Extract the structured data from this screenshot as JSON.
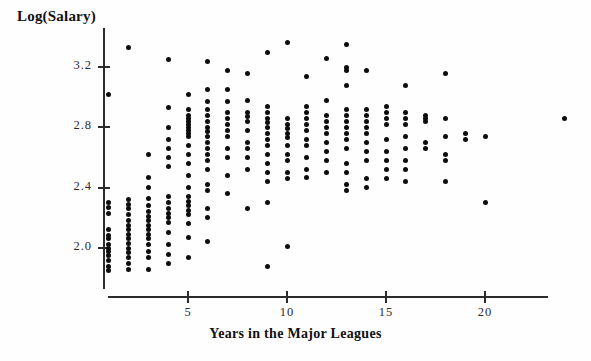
{
  "chart_data": {
    "type": "scatter",
    "title": "",
    "ylabel": "Log(Salary)",
    "xlabel": "Years in the Major Leagues",
    "grid": false,
    "legend": null,
    "xlim": [
      0,
      24.5
    ],
    "ylim": [
      1.8,
      3.45
    ],
    "xticks": [
      5,
      10,
      15,
      20
    ],
    "xtick_labels": [
      "5",
      "10",
      "15",
      "20"
    ],
    "yticks": [
      2.0,
      2.4,
      2.8,
      3.2
    ],
    "ytick_labels": [
      "2.0",
      "2.4",
      "2.8",
      "3.2"
    ],
    "n_points": 263,
    "points": [
      [
        1,
        3.02
      ],
      [
        1,
        2.3
      ],
      [
        1,
        2.27
      ],
      [
        1,
        2.23
      ],
      [
        1,
        2.12
      ],
      [
        1,
        2.08
      ],
      [
        1,
        2.06
      ],
      [
        1,
        2.02
      ],
      [
        1,
        2.0
      ],
      [
        1,
        1.98
      ],
      [
        1,
        1.95
      ],
      [
        1,
        1.92
      ],
      [
        1,
        1.88
      ],
      [
        1,
        1.85
      ],
      [
        2,
        3.33
      ],
      [
        2,
        2.32
      ],
      [
        2,
        2.29
      ],
      [
        2,
        2.26
      ],
      [
        2,
        2.22
      ],
      [
        2,
        2.18
      ],
      [
        2,
        2.15
      ],
      [
        2,
        2.12
      ],
      [
        2,
        2.09
      ],
      [
        2,
        2.06
      ],
      [
        2,
        2.03
      ],
      [
        2,
        2.0
      ],
      [
        2,
        1.97
      ],
      [
        2,
        1.94
      ],
      [
        2,
        1.9
      ],
      [
        2,
        1.86
      ],
      [
        3,
        2.62
      ],
      [
        3,
        2.47
      ],
      [
        3,
        2.4
      ],
      [
        3,
        2.33
      ],
      [
        3,
        2.28
      ],
      [
        3,
        2.24
      ],
      [
        3,
        2.21
      ],
      [
        3,
        2.18
      ],
      [
        3,
        2.15
      ],
      [
        3,
        2.12
      ],
      [
        3,
        2.09
      ],
      [
        3,
        2.06
      ],
      [
        3,
        2.02
      ],
      [
        3,
        1.98
      ],
      [
        3,
        1.94
      ],
      [
        3,
        1.86
      ],
      [
        4,
        3.25
      ],
      [
        4,
        2.93
      ],
      [
        4,
        2.8
      ],
      [
        4,
        2.72
      ],
      [
        4,
        2.66
      ],
      [
        4,
        2.6
      ],
      [
        4,
        2.54
      ],
      [
        4,
        2.34
      ],
      [
        4,
        2.3
      ],
      [
        4,
        2.26
      ],
      [
        4,
        2.23
      ],
      [
        4,
        2.2
      ],
      [
        4,
        2.17
      ],
      [
        4,
        2.1
      ],
      [
        4,
        2.02
      ],
      [
        4,
        1.96
      ],
      [
        4,
        1.9
      ],
      [
        5,
        3.02
      ],
      [
        5,
        2.92
      ],
      [
        5,
        2.88
      ],
      [
        5,
        2.86
      ],
      [
        5,
        2.84
      ],
      [
        5,
        2.82
      ],
      [
        5,
        2.8
      ],
      [
        5,
        2.78
      ],
      [
        5,
        2.76
      ],
      [
        5,
        2.74
      ],
      [
        5,
        2.68
      ],
      [
        5,
        2.62
      ],
      [
        5,
        2.56
      ],
      [
        5,
        2.48
      ],
      [
        5,
        2.4
      ],
      [
        5,
        2.34
      ],
      [
        5,
        2.31
      ],
      [
        5,
        2.28
      ],
      [
        5,
        2.25
      ],
      [
        5,
        2.22
      ],
      [
        5,
        2.16
      ],
      [
        5,
        2.07
      ],
      [
        5,
        1.94
      ],
      [
        6,
        3.24
      ],
      [
        6,
        3.05
      ],
      [
        6,
        2.97
      ],
      [
        6,
        2.92
      ],
      [
        6,
        2.88
      ],
      [
        6,
        2.84
      ],
      [
        6,
        2.8
      ],
      [
        6,
        2.77
      ],
      [
        6,
        2.74
      ],
      [
        6,
        2.7
      ],
      [
        6,
        2.66
      ],
      [
        6,
        2.62
      ],
      [
        6,
        2.58
      ],
      [
        6,
        2.52
      ],
      [
        6,
        2.42
      ],
      [
        6,
        2.38
      ],
      [
        6,
        2.26
      ],
      [
        6,
        2.2
      ],
      [
        6,
        2.04
      ],
      [
        7,
        3.18
      ],
      [
        7,
        3.05
      ],
      [
        7,
        2.97
      ],
      [
        7,
        2.9
      ],
      [
        7,
        2.86
      ],
      [
        7,
        2.82
      ],
      [
        7,
        2.78
      ],
      [
        7,
        2.74
      ],
      [
        7,
        2.66
      ],
      [
        7,
        2.6
      ],
      [
        7,
        2.48
      ],
      [
        7,
        2.36
      ],
      [
        8,
        3.16
      ],
      [
        8,
        2.98
      ],
      [
        8,
        2.9
      ],
      [
        8,
        2.87
      ],
      [
        8,
        2.84
      ],
      [
        8,
        2.78
      ],
      [
        8,
        2.7
      ],
      [
        8,
        2.66
      ],
      [
        8,
        2.6
      ],
      [
        8,
        2.52
      ],
      [
        8,
        2.26
      ],
      [
        9,
        3.3
      ],
      [
        9,
        2.94
      ],
      [
        9,
        2.9
      ],
      [
        9,
        2.86
      ],
      [
        9,
        2.83
      ],
      [
        9,
        2.8
      ],
      [
        9,
        2.76
      ],
      [
        9,
        2.72
      ],
      [
        9,
        2.68
      ],
      [
        9,
        2.62
      ],
      [
        9,
        2.56
      ],
      [
        9,
        2.5
      ],
      [
        9,
        2.44
      ],
      [
        9,
        2.3
      ],
      [
        9,
        1.88
      ],
      [
        10,
        3.36
      ],
      [
        10,
        2.86
      ],
      [
        10,
        2.82
      ],
      [
        10,
        2.79
      ],
      [
        10,
        2.76
      ],
      [
        10,
        2.73
      ],
      [
        10,
        2.68
      ],
      [
        10,
        2.62
      ],
      [
        10,
        2.58
      ],
      [
        10,
        2.5
      ],
      [
        10,
        2.46
      ],
      [
        10,
        2.01
      ],
      [
        11,
        3.14
      ],
      [
        11,
        2.94
      ],
      [
        11,
        2.9
      ],
      [
        11,
        2.86
      ],
      [
        11,
        2.82
      ],
      [
        11,
        2.78
      ],
      [
        11,
        2.72
      ],
      [
        11,
        2.68
      ],
      [
        11,
        2.6
      ],
      [
        11,
        2.52
      ],
      [
        11,
        2.47
      ],
      [
        12,
        3.26
      ],
      [
        12,
        2.98
      ],
      [
        12,
        2.88
      ],
      [
        12,
        2.84
      ],
      [
        12,
        2.8
      ],
      [
        12,
        2.76
      ],
      [
        12,
        2.7
      ],
      [
        12,
        2.64
      ],
      [
        12,
        2.58
      ],
      [
        12,
        2.5
      ],
      [
        13,
        3.35
      ],
      [
        13,
        3.2
      ],
      [
        13,
        3.18
      ],
      [
        13,
        3.08
      ],
      [
        13,
        2.92
      ],
      [
        13,
        2.88
      ],
      [
        13,
        2.84
      ],
      [
        13,
        2.8
      ],
      [
        13,
        2.76
      ],
      [
        13,
        2.72
      ],
      [
        13,
        2.66
      ],
      [
        13,
        2.56
      ],
      [
        13,
        2.5
      ],
      [
        13,
        2.42
      ],
      [
        13,
        2.38
      ],
      [
        14,
        3.18
      ],
      [
        14,
        2.92
      ],
      [
        14,
        2.88
      ],
      [
        14,
        2.84
      ],
      [
        14,
        2.8
      ],
      [
        14,
        2.76
      ],
      [
        14,
        2.7
      ],
      [
        14,
        2.64
      ],
      [
        14,
        2.58
      ],
      [
        14,
        2.46
      ],
      [
        14,
        2.4
      ],
      [
        15,
        2.94
      ],
      [
        15,
        2.9
      ],
      [
        15,
        2.86
      ],
      [
        15,
        2.82
      ],
      [
        15,
        2.72
      ],
      [
        15,
        2.64
      ],
      [
        15,
        2.58
      ],
      [
        15,
        2.52
      ],
      [
        15,
        2.46
      ],
      [
        16,
        3.08
      ],
      [
        16,
        2.9
      ],
      [
        16,
        2.86
      ],
      [
        16,
        2.82
      ],
      [
        16,
        2.74
      ],
      [
        16,
        2.66
      ],
      [
        16,
        2.58
      ],
      [
        16,
        2.52
      ],
      [
        16,
        2.44
      ],
      [
        17,
        2.88
      ],
      [
        17,
        2.86
      ],
      [
        17,
        2.84
      ],
      [
        17,
        2.7
      ],
      [
        17,
        2.66
      ],
      [
        18,
        3.16
      ],
      [
        18,
        2.86
      ],
      [
        18,
        2.74
      ],
      [
        18,
        2.62
      ],
      [
        18,
        2.58
      ],
      [
        18,
        2.44
      ],
      [
        19,
        2.76
      ],
      [
        19,
        2.72
      ],
      [
        20,
        2.74
      ],
      [
        20,
        2.3
      ],
      [
        24,
        2.86
      ]
    ]
  }
}
